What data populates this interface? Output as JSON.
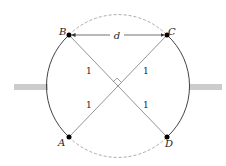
{
  "diagram": {
    "points": {
      "A": {
        "label": "A",
        "x": 69,
        "y": 137
      },
      "B": {
        "label": "B",
        "x": 69,
        "y": 35
      },
      "C": {
        "label": "C",
        "x": 167,
        "y": 35
      },
      "D": {
        "label": "D",
        "x": 167,
        "y": 137
      }
    },
    "distance_label": "d",
    "segment_labels": [
      "1",
      "1",
      "1",
      "1"
    ],
    "circle": {
      "cx": 117,
      "cy": 86,
      "r": 69
    },
    "colors": {
      "line": "#555555",
      "arc": "#444444",
      "dashed": "#aaaaaa",
      "bar": "#cccccc",
      "point": "#000000"
    }
  }
}
